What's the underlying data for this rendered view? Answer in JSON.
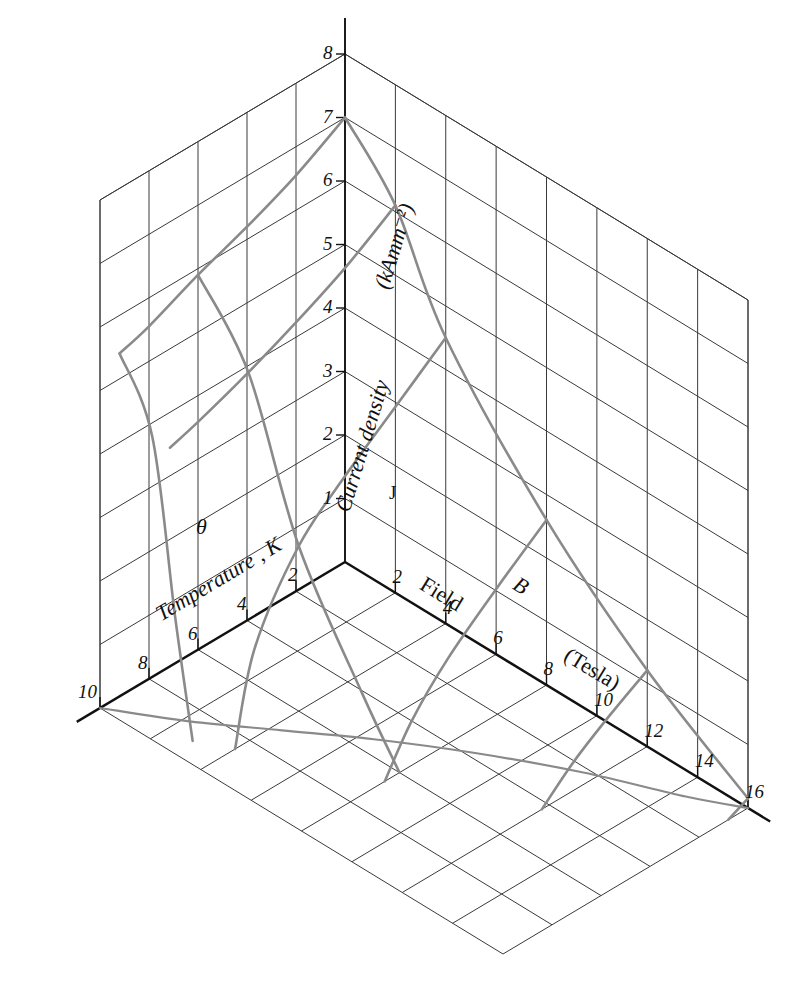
{
  "figure": {
    "type": "3d-surface-plot",
    "background_color": "#ffffff",
    "grid_color": "#3a3a3a",
    "axis_color": "#111111",
    "surface_color": "#8a8a8a"
  },
  "axes": {
    "x": {
      "name_parts": [
        "Temperature",
        ", ",
        "K"
      ],
      "symbol": "θ",
      "unit": "K",
      "ticks": [
        "2",
        "4",
        "6",
        "8",
        "10"
      ],
      "tick_values": [
        2,
        4,
        6,
        8,
        10
      ],
      "range": [
        0,
        10
      ],
      "direction": "increasing-left"
    },
    "y": {
      "name_parts": [
        "Field",
        "B",
        "(Tesla)"
      ],
      "symbol": "B",
      "unit": "Tesla",
      "ticks": [
        "2",
        "4",
        "6",
        "8",
        "10",
        "12",
        "14",
        "16"
      ],
      "tick_values": [
        2,
        4,
        6,
        8,
        10,
        12,
        14,
        16
      ],
      "range": [
        0,
        16
      ],
      "direction": "increasing-right"
    },
    "z": {
      "name_parts": [
        "Current density",
        "J",
        "(kAmm⁻²)"
      ],
      "symbol": "J",
      "unit": "kAmm⁻²",
      "ticks": [
        "1",
        "2",
        "3",
        "4",
        "5",
        "6",
        "7",
        "8"
      ],
      "tick_values": [
        1,
        2,
        3,
        4,
        5,
        6,
        7,
        8
      ],
      "range": [
        0,
        8
      ],
      "direction": "increasing-up"
    }
  },
  "labels": {
    "temperature_name": "Temperature",
    "temperature_comma": ",",
    "temperature_unit": "K",
    "temperature_symbol": "θ",
    "field_name": "Field",
    "field_symbol": "B",
    "field_unit": "(Tesla)",
    "current_name": "Current density",
    "current_symbol": "J",
    "current_unit": "(kAmm⁻²)"
  },
  "chart_data": {
    "type": "line",
    "title": "",
    "xlabel": "Temperature, θ (K)",
    "ylabel": "Field, B (Tesla)",
    "zlabel": "Current density, J (kAmm⁻²)",
    "xlim": [
      0,
      10
    ],
    "ylim": [
      0,
      16
    ],
    "zlim": [
      0,
      8
    ],
    "grid": true,
    "legend": "none",
    "mesh_lines_constant_field": [
      {
        "B": 0,
        "points": [
          {
            "theta": 0,
            "J": 7.0
          },
          {
            "theta": 2,
            "J": 6.55
          },
          {
            "theta": 4,
            "J": 6.2
          },
          {
            "theta": 6,
            "J": 5.9
          },
          {
            "theta": 8,
            "J": 5.55
          },
          {
            "theta": 9.2,
            "J": 5.4
          }
        ]
      },
      {
        "B": 2,
        "points": [
          {
            "theta": 0,
            "J": 6.1
          },
          {
            "theta": 2,
            "J": 5.6
          },
          {
            "theta": 4,
            "J": 5.2
          },
          {
            "theta": 6,
            "J": 4.85
          },
          {
            "theta": 8,
            "J": 4.55
          },
          {
            "theta": 9.2,
            "J": 4.4
          }
        ]
      },
      {
        "B": 4,
        "points": [
          {
            "theta": 0,
            "J": 4.5
          },
          {
            "theta": 2,
            "J": 3.9
          },
          {
            "theta": 4,
            "J": 3.3
          },
          {
            "theta": 6,
            "J": 2.6
          },
          {
            "theta": 7.8,
            "J": 1.4
          },
          {
            "theta": 8.6,
            "J": 0.0
          }
        ]
      },
      {
        "B": 8,
        "points": [
          {
            "theta": 0,
            "J": 2.6
          },
          {
            "theta": 2,
            "J": 2.0
          },
          {
            "theta": 4,
            "J": 1.35
          },
          {
            "theta": 5.5,
            "J": 0.7
          },
          {
            "theta": 6.6,
            "J": 0.0
          }
        ]
      },
      {
        "B": 12,
        "points": [
          {
            "theta": 0,
            "J": 1.2
          },
          {
            "theta": 1.5,
            "J": 0.85
          },
          {
            "theta": 3.0,
            "J": 0.45
          },
          {
            "theta": 4.3,
            "J": 0.0
          }
        ]
      },
      {
        "B": 16,
        "points": [
          {
            "theta": 0,
            "J": 0.15
          },
          {
            "theta": 0.8,
            "J": 0.0
          }
        ]
      }
    ],
    "mesh_lines_constant_temperature": [
      {
        "theta": 0,
        "points": [
          {
            "B": 0,
            "J": 7.0
          },
          {
            "B": 2,
            "J": 6.1
          },
          {
            "B": 4,
            "J": 4.5
          },
          {
            "B": 8,
            "J": 2.6
          },
          {
            "B": 12,
            "J": 1.2
          },
          {
            "B": 16,
            "J": 0.15
          }
        ]
      },
      {
        "theta": 6,
        "points": [
          {
            "B": 0,
            "J": 5.9
          },
          {
            "B": 2,
            "J": 4.85
          },
          {
            "B": 4,
            "J": 2.6
          },
          {
            "B": 6.5,
            "J": 0.9
          },
          {
            "B": 8,
            "J": 0.0
          }
        ]
      },
      {
        "theta": 9.2,
        "points": [
          {
            "B": 0,
            "J": 5.4
          },
          {
            "B": 1.3,
            "J": 4.4
          },
          {
            "B": 2.2,
            "J": 1.8
          },
          {
            "B": 2.9,
            "J": 0.0
          }
        ]
      }
    ],
    "zero_contour_on_floor": [
      {
        "theta": 10,
        "B": 0.0
      },
      {
        "theta": 8.6,
        "B": 2.2
      },
      {
        "theta": 7.0,
        "B": 4.3
      },
      {
        "theta": 5.4,
        "B": 6.4
      },
      {
        "theta": 3.8,
        "B": 8.8
      },
      {
        "theta": 2.2,
        "B": 11.6
      },
      {
        "theta": 0.9,
        "B": 14.4
      },
      {
        "theta": 0.0,
        "B": 16.0
      }
    ]
  }
}
